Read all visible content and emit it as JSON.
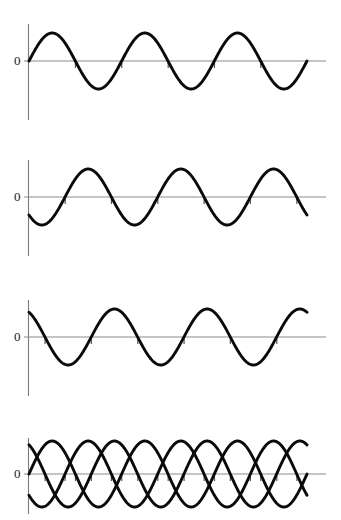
{
  "figure": {
    "title": "",
    "background_color": "#ffffff",
    "width": 341,
    "height": 520,
    "axis_label": "0",
    "wave_color": "#0a0a0a",
    "axis_color": "#8c8c8c"
  },
  "chart_data": {
    "type": "line",
    "title": "",
    "xlabel": "",
    "ylabel": "",
    "grid": false,
    "legend": "none",
    "xlim": [
      0,
      3.25
    ],
    "ylim": [
      -1.2,
      1.2
    ],
    "x_unit": "cycles",
    "panels": [
      {
        "name": "panel-1",
        "ytick_labels": [
          "0"
        ],
        "yticks": [
          0
        ],
        "series": [
          {
            "name": "wave-a",
            "form": "sine",
            "amplitude": 1.0,
            "cycles": 3.0,
            "phase_degrees": 0,
            "start_value": 0.0
          }
        ]
      },
      {
        "name": "panel-2",
        "ytick_labels": [
          "0"
        ],
        "yticks": [
          0
        ],
        "series": [
          {
            "name": "wave-b",
            "form": "sine",
            "amplitude": 1.0,
            "cycles": 3.0,
            "phase_degrees": -140,
            "start_value": -0.64
          }
        ]
      },
      {
        "name": "panel-3",
        "ytick_labels": [
          "0"
        ],
        "yticks": [
          0
        ],
        "series": [
          {
            "name": "wave-c",
            "form": "sine",
            "amplitude": 1.0,
            "cycles": 3.0,
            "phase_degrees": 118,
            "start_value": 0.88
          }
        ]
      },
      {
        "name": "panel-4-superposition",
        "ytick_labels": [
          "0"
        ],
        "yticks": [
          0
        ],
        "series": [
          {
            "name": "wave-a",
            "form": "sine",
            "amplitude": 1.0,
            "cycles": 3.0,
            "phase_degrees": 0,
            "start_value": 0.0
          },
          {
            "name": "wave-b",
            "form": "sine",
            "amplitude": 1.0,
            "cycles": 3.0,
            "phase_degrees": -140,
            "start_value": -0.64
          },
          {
            "name": "wave-c",
            "form": "sine",
            "amplitude": 1.0,
            "cycles": 3.0,
            "phase_degrees": 118,
            "start_value": 0.88
          }
        ]
      }
    ]
  }
}
